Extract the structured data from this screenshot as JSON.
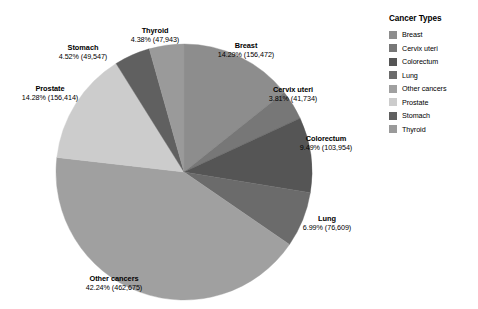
{
  "legend": {
    "title": "Cancer Types",
    "items": [
      {
        "label": "Breast",
        "color": "#8d8d8d"
      },
      {
        "label": "Cervix uteri",
        "color": "#777777"
      },
      {
        "label": "Colorectum",
        "color": "#555555"
      },
      {
        "label": "Lung",
        "color": "#6b6b6b"
      },
      {
        "label": "Other cancers",
        "color": "#a0a0a0"
      },
      {
        "label": "Prostate",
        "color": "#cccccc"
      },
      {
        "label": "Stomach",
        "color": "#606060"
      },
      {
        "label": "Thyroid",
        "color": "#9a9a9a"
      }
    ]
  },
  "labels": {
    "thyroid_name": "Thyroid",
    "thyroid_value": "4.38% (47,943)",
    "stomach_name": "Stomach",
    "stomach_value": "4.52% (49,547)",
    "breast_name": "Breast",
    "breast_value": "14.29% (156,472)",
    "cervix_name": "Cervix uteri",
    "cervix_value": "3.81% (41,734)",
    "colorectum_name": "Colorectum",
    "colorectum_value": "9.49% (103,954)",
    "lung_name": "Lung",
    "lung_value": "6.99% (76,609)",
    "other_name": "Other cancers",
    "other_value": "42.24% (462,675)",
    "prostate_name": "Prostate",
    "prostate_value": "14.28% (156,414)"
  },
  "chart_data": {
    "type": "pie",
    "title": "",
    "legend_title": "Cancer Types",
    "legend_position": "right",
    "grid": false,
    "total": 1095348,
    "categories": [
      "Breast",
      "Cervix uteri",
      "Colorectum",
      "Lung",
      "Other cancers",
      "Prostate",
      "Stomach",
      "Thyroid"
    ],
    "values": [
      156472,
      41734,
      103954,
      76609,
      462675,
      156414,
      49547,
      47943
    ],
    "percentages": [
      14.29,
      3.81,
      9.49,
      6.99,
      42.24,
      14.28,
      4.52,
      4.38
    ],
    "colors": [
      "#8d8d8d",
      "#777777",
      "#555555",
      "#6b6b6b",
      "#a0a0a0",
      "#cccccc",
      "#606060",
      "#9a9a9a"
    ],
    "slice_order_clockwise_from_top": [
      "Breast",
      "Cervix uteri",
      "Colorectum",
      "Lung",
      "Other cancers",
      "Prostate",
      "Stomach",
      "Thyroid"
    ],
    "data_labels": [
      "Breast 14.29% (156,472)",
      "Cervix uteri 3.81% (41,734)",
      "Colorectum 9.49% (103,954)",
      "Lung 6.99% (76,609)",
      "Other cancers 42.24% (462,675)",
      "Prostate 14.28% (156,414)",
      "Stomach 4.52% (49,547)",
      "Thyroid 4.38% (47,943)"
    ]
  }
}
